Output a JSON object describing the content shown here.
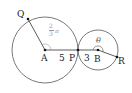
{
  "diagram": {
    "points": {
      "Q": "Q",
      "A": "A",
      "P": "P",
      "B": "B",
      "R": "R"
    },
    "lengths": {
      "AP": "5",
      "PB": "3"
    },
    "angles": {
      "at_A_num": "2",
      "at_A_den": "3",
      "at_A_pi": "π",
      "at_B": "θ"
    },
    "colors": {
      "line": "#444444",
      "angle_label": "#999999"
    }
  }
}
